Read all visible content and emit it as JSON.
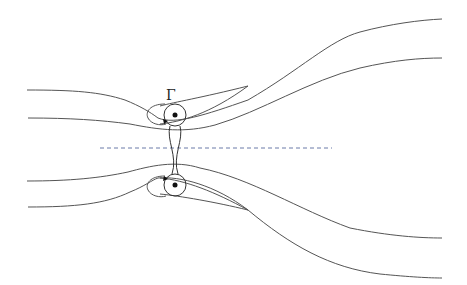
{
  "diagram": {
    "type": "vortex-pair-streamlines",
    "label_gamma": "Γ",
    "colors": {
      "streamline": "#555555",
      "vortex": "#333333",
      "axis": "#6a7aa8"
    },
    "axis_line": {
      "x1": 100,
      "x2": 332,
      "y": 148
    },
    "vortices": [
      {
        "name": "upper-vortex",
        "cx": 175,
        "cy": 115
      },
      {
        "name": "lower-vortex",
        "cx": 175,
        "cy": 185
      }
    ]
  }
}
